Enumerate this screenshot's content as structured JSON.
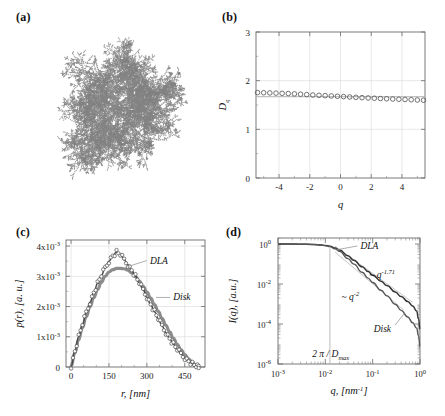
{
  "figure": {
    "width": 445,
    "height": 416,
    "background": "#ffffff"
  },
  "panels": {
    "a": {
      "label": "(a)",
      "caption": "DLA cluster image",
      "icon": "dla-fractal-cluster",
      "color": "#808080"
    },
    "b": {
      "label": "(b)"
    },
    "c": {
      "label": "(c)"
    },
    "d": {
      "label": "(d)"
    }
  },
  "chart_data": [
    {
      "panel": "a",
      "type": "scatter",
      "title": "",
      "xlabel": "",
      "ylabel": "",
      "grid": false,
      "legend": "none",
      "description": "Diffusion-limited-aggregation fractal cluster rendered as a dense branched point set",
      "seed": 20240517,
      "n_points": 5200,
      "branches": 6,
      "point_color": "#8a8a8a",
      "x": [],
      "y": []
    },
    {
      "panel": "b",
      "type": "scatter",
      "title": "",
      "xlabel": "q",
      "ylabel": "D_q",
      "xlim": [
        -5.5,
        5.5
      ],
      "ylim": [
        0,
        3
      ],
      "xticks": [
        -4,
        -2,
        0,
        2,
        4
      ],
      "yticks": [
        0,
        1,
        2,
        3
      ],
      "xtick_labels": [
        "-4",
        "-2",
        "0",
        "2",
        "4"
      ],
      "ytick_labels": [
        "0",
        "1",
        "2",
        "3"
      ],
      "grid": true,
      "marker": "open-circle",
      "marker_color": "#5a5a5a",
      "reference_line": {
        "value": 1.67,
        "color": "#b0b0b0",
        "label": ""
      },
      "x": [
        -5.4,
        -5.0,
        -4.6,
        -4.2,
        -3.8,
        -3.4,
        -3.0,
        -2.6,
        -2.2,
        -1.8,
        -1.4,
        -1.0,
        -0.6,
        -0.2,
        0.2,
        0.6,
        1.0,
        1.4,
        1.8,
        2.2,
        2.6,
        3.0,
        3.4,
        3.8,
        4.2,
        4.6,
        5.0,
        5.4
      ],
      "values": [
        1.755,
        1.752,
        1.748,
        1.744,
        1.74,
        1.735,
        1.729,
        1.722,
        1.714,
        1.706,
        1.699,
        1.692,
        1.686,
        1.679,
        1.672,
        1.665,
        1.658,
        1.651,
        1.645,
        1.639,
        1.633,
        1.628,
        1.623,
        1.618,
        1.613,
        1.608,
        1.603,
        1.598
      ]
    },
    {
      "panel": "c",
      "type": "line",
      "title": "",
      "xlabel": "r, [nm]",
      "ylabel": "p(r), [a. u.]",
      "xlim": [
        -20,
        530
      ],
      "ylim": [
        0,
        4.2
      ],
      "y_scale_note": "values in units of 1x10^-3",
      "xticks": [
        0,
        150,
        300,
        450
      ],
      "yticks": [
        0,
        1,
        2,
        3,
        4
      ],
      "xtick_labels": [
        "0",
        "150",
        "300",
        "450"
      ],
      "ytick_labels": [
        "0",
        "1x10",
        "2x10",
        "3x10",
        "4x10"
      ],
      "ytick_exponent": "-3",
      "grid": true,
      "legend": "inline-annotation",
      "annotations": [
        {
          "text": "DLA",
          "x": 255,
          "y": 3.45
        },
        {
          "text": "Disk",
          "x": 360,
          "y": 2.35
        }
      ],
      "series": [
        {
          "name": "DLA",
          "style": "open-circles",
          "color": "#4a4a4a",
          "peak_x": 180,
          "peak_y": 3.8,
          "end_x": 500,
          "x": [
            0,
            15,
            30,
            45,
            60,
            75,
            90,
            105,
            120,
            135,
            150,
            165,
            180,
            195,
            210,
            225,
            240,
            255,
            270,
            285,
            300,
            315,
            330,
            345,
            360,
            375,
            390,
            405,
            420,
            435,
            450,
            465,
            480,
            495,
            505
          ],
          "values": [
            0.02,
            0.52,
            1.0,
            1.42,
            1.8,
            2.14,
            2.46,
            2.76,
            3.03,
            3.28,
            3.5,
            3.68,
            3.8,
            3.72,
            3.55,
            3.38,
            3.2,
            3.0,
            2.78,
            2.55,
            2.31,
            2.07,
            1.83,
            1.59,
            1.36,
            1.14,
            0.94,
            0.75,
            0.58,
            0.43,
            0.3,
            0.19,
            0.1,
            0.03,
            0.0
          ]
        },
        {
          "name": "Disk",
          "style": "thick-line",
          "color": "#8c8c8c",
          "peak_x": 210,
          "peak_y": 3.26,
          "end_x": 505,
          "x": [
            0,
            15,
            30,
            45,
            60,
            75,
            90,
            105,
            120,
            135,
            150,
            165,
            180,
            195,
            210,
            225,
            240,
            255,
            270,
            285,
            300,
            315,
            330,
            345,
            360,
            375,
            390,
            405,
            420,
            435,
            450,
            465,
            480,
            495,
            505
          ],
          "values": [
            0.02,
            0.46,
            0.9,
            1.3,
            1.66,
            1.99,
            2.29,
            2.56,
            2.8,
            3.0,
            3.14,
            3.22,
            3.26,
            3.26,
            3.25,
            3.2,
            3.11,
            2.99,
            2.84,
            2.67,
            2.48,
            2.28,
            2.06,
            1.84,
            1.61,
            1.38,
            1.16,
            0.95,
            0.75,
            0.57,
            0.41,
            0.27,
            0.15,
            0.05,
            0.0
          ]
        }
      ]
    },
    {
      "panel": "d",
      "type": "line",
      "title": "",
      "xlabel": "q, [nm",
      "xlabel_sup": "-1",
      "xlabel_tail": "]",
      "ylabel": "I(q), [a.u.]",
      "xscale": "log",
      "yscale": "log",
      "xlim": [
        0.001,
        1.0
      ],
      "ylim": [
        1e-06,
        2.0
      ],
      "xticks": [
        0.001,
        0.01,
        0.1,
        1.0
      ],
      "yticks": [
        1e-06,
        0.0001,
        0.01,
        1.0
      ],
      "xtick_labels": [
        "10",
        "10",
        "10",
        "10"
      ],
      "xtick_exponents": [
        "-3",
        "-2",
        "-1",
        "0"
      ],
      "ytick_labels": [
        "10",
        "10",
        "10",
        "10"
      ],
      "ytick_exponents": [
        "-6",
        "-4",
        "-2",
        "0"
      ],
      "grid": false,
      "legend": "inline-annotation",
      "annotations": [
        {
          "text": "DLA",
          "name": "dla-label"
        },
        {
          "text": "Disk",
          "name": "disk-label"
        },
        {
          "text": "~ q",
          "sup": "-1.71",
          "name": "power-law-dla"
        },
        {
          "text": "~ q",
          "sup": "-2",
          "name": "power-law-disk"
        },
        {
          "text": "2 π / D",
          "sub": "max",
          "name": "dmax-marker"
        }
      ],
      "marker_line": {
        "x": 0.0125,
        "label": "2 π / Dmax",
        "color": "#b5b5b5"
      },
      "guide_lines": [
        {
          "name": "slope -1.71",
          "slope": -1.71,
          "color": "#c8c8c8"
        },
        {
          "name": "slope -2",
          "slope": -2.0,
          "color": "#c8c8c8"
        }
      ],
      "series": [
        {
          "name": "DLA",
          "color": "#333333",
          "slope": -1.71,
          "x": [
            0.001,
            0.002,
            0.004,
            0.006,
            0.008,
            0.01,
            0.0125,
            0.016,
            0.02,
            0.03,
            0.04,
            0.06,
            0.08,
            0.1,
            0.15,
            0.2,
            0.3,
            0.4,
            0.55,
            0.7,
            0.85,
            0.93,
            1.0
          ],
          "values": [
            1.0,
            0.995,
            0.975,
            0.945,
            0.905,
            0.855,
            0.78,
            0.64,
            0.5,
            0.258,
            0.155,
            0.072,
            0.042,
            0.0275,
            0.0139,
            0.0084,
            0.004,
            0.00235,
            0.00135,
            0.0008,
            0.00045,
            0.00018,
            5.5e-05
          ]
        },
        {
          "name": "Disk",
          "color": "#555555",
          "slope": -2.0,
          "x": [
            0.001,
            0.002,
            0.004,
            0.006,
            0.008,
            0.01,
            0.0125,
            0.016,
            0.02,
            0.03,
            0.04,
            0.06,
            0.08,
            0.1,
            0.15,
            0.2,
            0.3,
            0.4,
            0.55,
            0.7,
            0.85,
            0.93,
            1.0
          ],
          "values": [
            1.0,
            0.993,
            0.97,
            0.935,
            0.89,
            0.835,
            0.745,
            0.585,
            0.43,
            0.185,
            0.099,
            0.0385,
            0.0198,
            0.012,
            0.0049,
            0.00255,
            0.00098,
            0.00048,
            0.000225,
            0.000115,
            6.25e-05,
            2.6e-05,
            7.5e-06
          ]
        }
      ]
    }
  ]
}
